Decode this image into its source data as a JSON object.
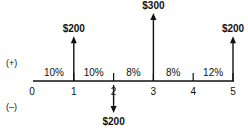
{
  "diagram": {
    "type": "cash-flow-diagram",
    "sign_labels": {
      "positive": "(+)",
      "negative": "(–)"
    },
    "periods": [
      "0",
      "1",
      "2",
      "3",
      "4",
      "5"
    ],
    "interest_rates": [
      "10%",
      "10%",
      "8%",
      "8%",
      "12%"
    ],
    "cash_flows": [
      {
        "period": 1,
        "amount": 200,
        "label": "$200",
        "direction": "up"
      },
      {
        "period": 2,
        "amount": -200,
        "label": "$200",
        "direction": "down"
      },
      {
        "period": 3,
        "amount": 300,
        "label": "$300",
        "direction": "up"
      },
      {
        "period": 5,
        "amount": 200,
        "label": "$200",
        "direction": "up"
      }
    ],
    "colors": {
      "ink": "#111111",
      "background": "#ffffff"
    }
  }
}
